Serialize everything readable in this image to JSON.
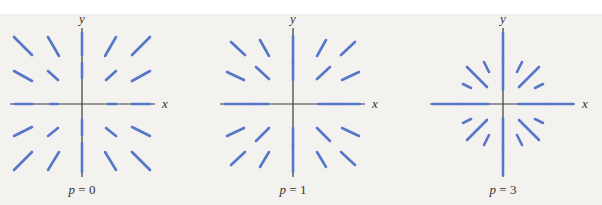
{
  "figure": {
    "colors": {
      "background": "#f3f2ee",
      "axis": "#3a3a3a",
      "vector": "#5677c9",
      "text": "#333333"
    },
    "axis_labels": {
      "x": "x",
      "y": "y"
    },
    "panels": [
      {
        "id": "p0",
        "label": "p = 0",
        "label_var": "p",
        "label_eq": " = ",
        "label_num": "0",
        "origin": [
          82,
          104
        ],
        "x_axis": [
          10,
          155
        ],
        "y_axis": [
          28,
          177
        ],
        "vectors": [
          [
            14,
            37,
            32,
            55
          ],
          [
            48,
            37,
            59,
            56
          ],
          [
            14,
            71,
            32,
            81
          ],
          [
            48,
            71,
            58,
            80
          ],
          [
            150,
            37,
            132,
            55
          ],
          [
            116,
            37,
            105,
            56
          ],
          [
            150,
            71,
            132,
            81
          ],
          [
            116,
            71,
            106,
            80
          ],
          [
            14,
            170,
            32,
            152
          ],
          [
            48,
            170,
            59,
            152
          ],
          [
            14,
            136,
            32,
            127
          ],
          [
            48,
            136,
            58,
            128
          ],
          [
            150,
            170,
            132,
            152
          ],
          [
            116,
            170,
            105,
            152
          ],
          [
            150,
            136,
            132,
            127
          ],
          [
            116,
            136,
            106,
            128
          ],
          [
            82,
            33,
            82,
            55
          ],
          [
            82,
            63,
            82,
            78
          ],
          [
            82,
            120,
            82,
            135
          ],
          [
            82,
            143,
            82,
            172
          ],
          [
            15,
            104,
            32,
            104
          ],
          [
            50,
            104,
            58,
            104
          ],
          [
            108,
            104,
            116,
            104
          ],
          [
            132,
            104,
            150,
            104
          ]
        ]
      },
      {
        "id": "p1",
        "label": "p = 1",
        "label_var": "p",
        "label_eq": " = ",
        "label_num": "1",
        "origin": [
          293,
          104
        ],
        "x_axis": [
          220,
          365
        ],
        "y_axis": [
          28,
          177
        ],
        "vectors": [
          [
            231,
            42,
            245,
            55
          ],
          [
            260,
            40,
            269,
            56
          ],
          [
            227,
            72,
            244,
            80
          ],
          [
            256,
            67,
            269,
            79
          ],
          [
            355,
            42,
            341,
            55
          ],
          [
            326,
            40,
            317,
            56
          ],
          [
            359,
            72,
            342,
            80
          ],
          [
            330,
            67,
            317,
            79
          ],
          [
            231,
            165,
            245,
            152
          ],
          [
            260,
            167,
            269,
            152
          ],
          [
            227,
            136,
            244,
            128
          ],
          [
            256,
            141,
            269,
            128
          ],
          [
            355,
            165,
            341,
            152
          ],
          [
            326,
            167,
            317,
            152
          ],
          [
            359,
            136,
            342,
            128
          ],
          [
            330,
            141,
            317,
            128
          ],
          [
            293,
            36,
            293,
            62
          ],
          [
            293,
            62,
            293,
            80
          ],
          [
            293,
            128,
            293,
            146
          ],
          [
            293,
            146,
            293,
            172
          ],
          [
            225,
            104,
            250,
            104
          ],
          [
            250,
            104,
            268,
            104
          ],
          [
            318,
            104,
            336,
            104
          ],
          [
            336,
            104,
            360,
            104
          ]
        ]
      },
      {
        "id": "p3",
        "label": "p = 3",
        "label_var": "p",
        "label_eq": " = ",
        "label_num": "3",
        "origin": [
          503,
          104
        ],
        "x_axis": [
          430,
          575
        ],
        "y_axis": [
          28,
          177
        ],
        "vectors": [
          [
            467,
            67,
            487,
            87
          ],
          [
            484,
            62,
            489,
            72
          ],
          [
            463,
            84,
            471,
            88
          ],
          [
            539,
            67,
            519,
            87
          ],
          [
            522,
            62,
            517,
            72
          ],
          [
            543,
            84,
            535,
            88
          ],
          [
            467,
            140,
            487,
            120
          ],
          [
            484,
            145,
            489,
            135
          ],
          [
            463,
            123,
            471,
            119
          ],
          [
            539,
            140,
            519,
            120
          ],
          [
            522,
            145,
            517,
            135
          ],
          [
            543,
            123,
            535,
            119
          ],
          [
            503,
            33,
            503,
            62
          ],
          [
            503,
            62,
            503,
            90
          ],
          [
            503,
            118,
            503,
            146
          ],
          [
            503,
            146,
            503,
            175
          ],
          [
            433,
            104,
            460,
            104
          ],
          [
            460,
            104,
            488,
            104
          ],
          [
            518,
            104,
            546,
            104
          ],
          [
            546,
            104,
            573,
            104
          ]
        ]
      }
    ]
  }
}
